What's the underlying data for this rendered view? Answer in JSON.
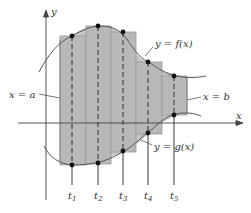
{
  "colors": {
    "region_fill": "#b8b8b8",
    "rect_stroke": "#999999",
    "curve": "#555555",
    "axis": "#444444",
    "dot": "#111111",
    "text": "#333333"
  },
  "axes": {
    "x_label": "x",
    "y_label": "y"
  },
  "labels": {
    "f_curve": "y = f(x)",
    "g_curve": "y = g(x)",
    "left_bound": "x = a",
    "right_bound": "x = b"
  },
  "sample_points": [
    {
      "name": "t",
      "sub": "1"
    },
    {
      "name": "t",
      "sub": "2"
    },
    {
      "name": "t",
      "sub": "3"
    },
    {
      "name": "t",
      "sub": "4"
    },
    {
      "name": "t",
      "sub": "5"
    }
  ],
  "rectangles": [
    {
      "x0": 60,
      "x1": 86,
      "top": 36,
      "bottom": 165
    },
    {
      "x0": 86,
      "x1": 111,
      "top": 26,
      "bottom": 164
    },
    {
      "x0": 111,
      "x1": 136,
      "top": 32,
      "bottom": 152
    },
    {
      "x0": 136,
      "x1": 162,
      "top": 62,
      "bottom": 134
    },
    {
      "x0": 162,
      "x1": 187,
      "top": 76,
      "bottom": 115
    }
  ]
}
